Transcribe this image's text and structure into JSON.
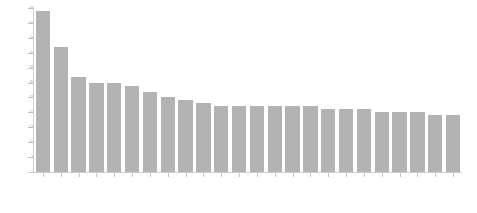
{
  "chart_data": {
    "type": "bar",
    "title": "",
    "subtitle": "",
    "xlabel": "",
    "ylabel": "",
    "ylim": [
      0,
      55
    ],
    "yticks": [
      0,
      5,
      10,
      15,
      20,
      25,
      30,
      35,
      40,
      45,
      50,
      55
    ],
    "ytick_labels": [
      "0",
      "5",
      "10",
      "15",
      "20",
      "25",
      "30",
      "35",
      "40",
      "45",
      "50",
      "55"
    ],
    "grid": false,
    "legend": false,
    "legend_position": "none",
    "orientation": "vertical",
    "sorted": "descending",
    "bar_color": "#b3b3b3",
    "background_color": "#ffffff",
    "axis_color": "#cfcfcf",
    "tick_label_color": "#a8a8a8",
    "category_label_rotation": 48,
    "category_label_legible": false,
    "bar_count": 24,
    "categories": [
      "",
      "",
      "",
      "",
      "",
      "",
      "",
      "",
      "",
      "",
      "",
      "",
      "",
      "",
      "",
      "",
      "",
      "",
      "",
      "",
      "",
      "",
      "",
      ""
    ],
    "values": [
      54,
      42,
      32,
      30,
      30,
      29,
      27,
      25,
      24,
      23,
      22,
      22,
      22,
      22,
      22,
      22,
      21,
      21,
      21,
      20,
      20,
      20,
      19,
      19
    ]
  }
}
